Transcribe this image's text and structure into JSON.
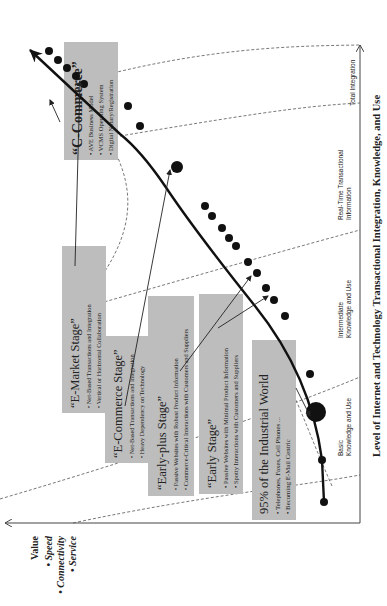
{
  "diagram": {
    "orientation": "rotated 90 degrees counter-clockwise",
    "y_axis": {
      "title": "Value",
      "items": [
        "Speed",
        "Connectivity",
        "Service"
      ]
    },
    "x_axis": {
      "title": "Level of Internet and Technology Transactional Integration, Knowledge, and Use",
      "levels": [
        {
          "line1": "Basic",
          "line2": "Knowledge and Use"
        },
        {
          "line1": "Intermediate",
          "line2": "Knowledge and Use"
        },
        {
          "line1": "Real-Time Transactional",
          "line2": "Information"
        },
        {
          "line1": "Total Integration",
          "line2": ""
        }
      ]
    },
    "stages": [
      {
        "title": "95% of the Industrial World",
        "bullets": [
          "Telephones, Faxes, Cell Phones ...",
          "Becoming E-Mail Centric"
        ]
      },
      {
        "title": "“Early Stage”",
        "bullets": [
          "Passive Websites with Minimal Product Information",
          "Spotty Interactions with Customers and Suppliers"
        ]
      },
      {
        "title": "“Early-plus Stage”",
        "bullets": [
          "Passive Websites with Robust Product Information",
          "Commerce-Critical Interactions with Customers and Suppliers"
        ]
      },
      {
        "title": "“E-Commerce Stage”",
        "bullets": [
          "Net-Based Transactions and Integration",
          "Heavy Dependency on Technology"
        ]
      },
      {
        "title": "“E-Market Stage”",
        "bullets": [
          "Net-Based Transactions and Integration",
          "Vertical or Horizontal Collaboration"
        ]
      },
      {
        "title": "“C-Commerce”",
        "bullets": [
          "AVE Business Model",
          "VCMS Operating System",
          "Digital Notary/Registration"
        ]
      }
    ],
    "bullet_glyph": "•",
    "colors": {
      "box_fill": "#bdbdbd",
      "curve": "#111111",
      "axis": "#444444",
      "background": "#ffffff"
    }
  }
}
